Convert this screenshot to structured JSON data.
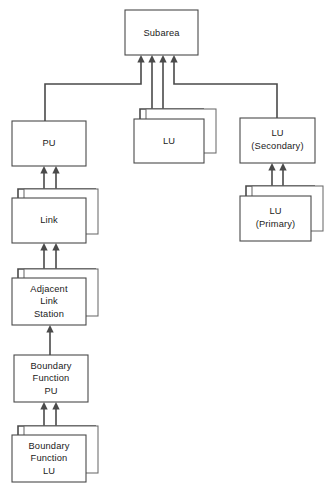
{
  "diagram": {
    "type": "hierarchy-tree",
    "background_color": "#ffffff",
    "line_color": "#4a4a4a",
    "text_color": "#1a1a1a",
    "nodes": [
      {
        "id": "subarea",
        "label": "Subarea",
        "lines": [
          "Subarea"
        ],
        "stacked": false,
        "x": 125,
        "y": 10,
        "w": 73,
        "h": 45
      },
      {
        "id": "pu",
        "label": "PU",
        "lines": [
          "PU"
        ],
        "stacked": false,
        "x": 12,
        "y": 121,
        "w": 74,
        "h": 45
      },
      {
        "id": "lu",
        "label": "LU",
        "lines": [
          "LU"
        ],
        "stacked": true,
        "x": 134,
        "y": 119,
        "w": 70,
        "h": 44
      },
      {
        "id": "lu-secondary",
        "label": "LU (Secondary)",
        "lines": [
          "LU",
          "(Secondary)"
        ],
        "stacked": false,
        "x": 240,
        "y": 118,
        "w": 75,
        "h": 45
      },
      {
        "id": "lu-primary",
        "label": "LU (Primary)",
        "lines": [
          "LU",
          "(Primary)"
        ],
        "stacked": true,
        "x": 240,
        "y": 196,
        "w": 75,
        "h": 45
      },
      {
        "id": "link",
        "label": "Link",
        "lines": [
          "Link"
        ],
        "stacked": true,
        "x": 12,
        "y": 198,
        "w": 74,
        "h": 45
      },
      {
        "id": "adjacent-link-station",
        "label": "Adjacent Link Station",
        "lines": [
          "Adjacent",
          "Link",
          "Station"
        ],
        "stacked": true,
        "x": 12,
        "y": 278,
        "w": 74,
        "h": 47
      },
      {
        "id": "boundary-function-pu",
        "label": "Boundary Function PU",
        "lines": [
          "Boundary",
          "Function",
          "PU"
        ],
        "stacked": false,
        "x": 14,
        "y": 355,
        "w": 74,
        "h": 47
      },
      {
        "id": "boundary-function-lu",
        "label": "Boundary Function LU",
        "lines": [
          "Boundary",
          "Function",
          "LU"
        ],
        "stacked": true,
        "x": 12,
        "y": 435,
        "w": 74,
        "h": 47
      }
    ],
    "connections": [
      {
        "id": "pu-to-subarea",
        "from": "pu",
        "to": "subarea",
        "arrows": 1
      },
      {
        "id": "lu-to-subarea",
        "from": "lu",
        "to": "subarea",
        "arrows": 2
      },
      {
        "id": "lu-secondary-to-subarea",
        "from": "lu-secondary",
        "to": "subarea",
        "arrows": 1
      },
      {
        "id": "lu-primary-to-lu-secondary",
        "from": "lu-primary",
        "to": "lu-secondary",
        "arrows": 2
      },
      {
        "id": "link-to-pu",
        "from": "link",
        "to": "pu",
        "arrows": 2
      },
      {
        "id": "adjacent-link-station-to-link",
        "from": "adjacent-link-station",
        "to": "link",
        "arrows": 2
      },
      {
        "id": "boundary-function-pu-to-adjacent-link-station",
        "from": "boundary-function-pu",
        "to": "adjacent-link-station",
        "arrows": 1
      },
      {
        "id": "boundary-function-lu-to-boundary-function-pu",
        "from": "boundary-function-lu",
        "to": "boundary-function-pu",
        "arrows": 2
      }
    ]
  }
}
